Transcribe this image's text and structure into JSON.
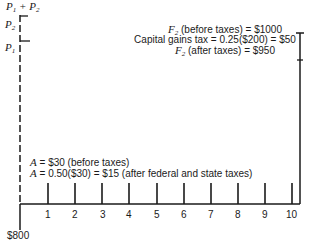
{
  "diagram": {
    "left_axis": {
      "top_label": "P1 + P2",
      "p2_label": "P2",
      "p1_label": "P1",
      "bottom_label": "$800"
    },
    "right_annotation": {
      "line1": "F2 (before taxes) = $1000",
      "line2": "Capital gains tax = 0.25($200) = $50",
      "line3": "F2 (after taxes) = $950"
    },
    "annuity_annotation": {
      "line1": "A = $30 (before taxes)",
      "line2": "A = 0.50($30) = $15 (after federal and state taxes)"
    },
    "periods": [
      "1",
      "2",
      "3",
      "4",
      "5",
      "6",
      "7",
      "8",
      "9",
      "10"
    ],
    "line_color": "#1a1a1a"
  }
}
